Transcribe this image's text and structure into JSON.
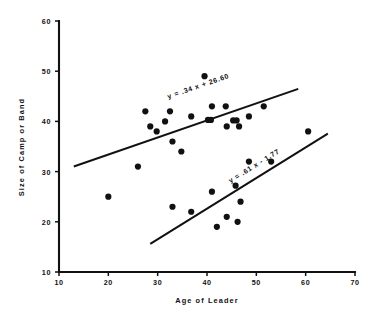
{
  "chart_data": {
    "type": "scatter",
    "title": "",
    "xlabel": "Age of Leader",
    "ylabel": "Size of Camp or Band",
    "xlim": [
      10,
      70
    ],
    "ylim": [
      10,
      60
    ],
    "xticks": [
      10,
      20,
      30,
      40,
      50,
      60,
      70
    ],
    "yticks": [
      10,
      20,
      30,
      40,
      50,
      60
    ],
    "xtick_labels": [
      "10",
      "20",
      "30",
      "40",
      "50",
      "60",
      "70"
    ],
    "ytick_labels": [
      "10",
      "20",
      "30",
      "40",
      "50",
      "60"
    ],
    "grid": false,
    "legend": "none",
    "series": [
      {
        "name": "upper-group",
        "marker": "filled-circle",
        "color": "#111111",
        "points": [
          [
            20.0,
            25.0
          ],
          [
            26.0,
            31.0
          ],
          [
            27.5,
            42.0
          ],
          [
            28.5,
            39.0
          ],
          [
            29.8,
            38.0
          ],
          [
            31.5,
            40.0
          ],
          [
            32.5,
            42.0
          ],
          [
            33.0,
            36.0
          ],
          [
            34.8,
            34.0
          ],
          [
            36.8,
            41.0
          ],
          [
            39.5,
            49.0
          ],
          [
            40.2,
            40.3
          ],
          [
            40.8,
            40.3
          ],
          [
            41.0,
            43.0
          ],
          [
            43.8,
            43.0
          ],
          [
            44.0,
            39.0
          ],
          [
            45.3,
            40.2
          ],
          [
            46.0,
            40.2
          ],
          [
            46.5,
            39.0
          ],
          [
            48.5,
            41.0
          ],
          [
            51.5,
            43.0
          ]
        ]
      },
      {
        "name": "lower-group",
        "marker": "filled-circle",
        "color": "#111111",
        "points": [
          [
            33.0,
            23.0
          ],
          [
            36.8,
            22.0
          ],
          [
            41.0,
            26.0
          ],
          [
            42.0,
            19.0
          ],
          [
            44.0,
            21.0
          ],
          [
            45.8,
            27.2
          ],
          [
            46.2,
            20.0
          ],
          [
            46.8,
            24.0
          ],
          [
            48.5,
            32.0
          ],
          [
            53.0,
            32.0
          ],
          [
            60.5,
            38.0
          ]
        ]
      }
    ],
    "fit_lines": [
      {
        "name": "upper-regression",
        "equation_label": "y = .34 x + 26.60",
        "slope": 0.34,
        "intercept": 26.6,
        "x_start": 13.0,
        "x_end": 58.5
      },
      {
        "name": "lower-regression",
        "equation_label": "y = .61 x - 1.77",
        "slope": 0.61,
        "intercept": -1.77,
        "x_start": 28.5,
        "x_end": 64.5
      }
    ]
  }
}
